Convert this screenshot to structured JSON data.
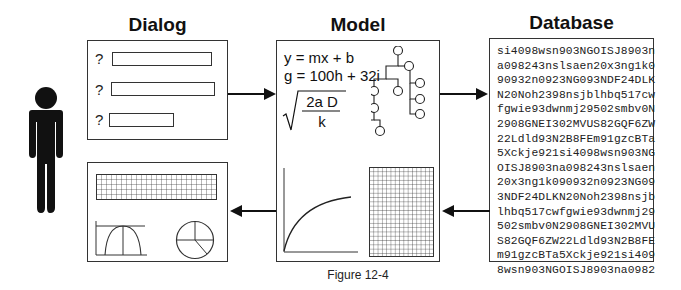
{
  "titles": {
    "dialog": "Dialog",
    "model": "Model",
    "database": "Database"
  },
  "dialog": {
    "fields": [
      {
        "label": "?",
        "width": 100
      },
      {
        "label": "?",
        "width": 104
      },
      {
        "label": "?",
        "width": 65
      }
    ]
  },
  "model": {
    "equations": [
      "y = mx + b",
      "g = 100h + 32i"
    ],
    "sqrt_numerator": "2a D",
    "sqrt_denominator": "k"
  },
  "database": {
    "lines": [
      "si4098wsn903NGOISJ8903n",
      "a098243nslsaen20x3ng1k0",
      "90932n0923NG093NDF24DLK",
      "N20Noh2398nsjblhbq517cw",
      "fgwie93dwnmj29502smbv0N",
      "2908GNEI302MVUS82GQF6ZW",
      "22Ldld93N2B8FEm91gzcBTa",
      "5Xckje921si4098wsn903NG",
      "OISJ8903na098243nslsaen",
      "20x3ng1k090932n0923NG09",
      "3NDF24DLKN20Noh2398nsjb",
      "lhbq517cwfgwie93dwnmj29",
      "502smbv0N2908GNEI302MVU",
      "S82GQF6ZW22Ldld93N2B8FE",
      "m91gzcBTa5Xckje921si409",
      "8wsn903NGOISJ8903na0982"
    ]
  },
  "icons": {
    "person": "person-icon",
    "tree": "tree-diagram-icon",
    "curve": "curve-chart-icon",
    "grid": "grid-table-icon",
    "bell": "bell-curve-chart-icon",
    "pie": "pie-chart-icon"
  },
  "caption": "Figure 12-4"
}
